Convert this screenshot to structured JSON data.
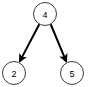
{
  "diagram": {
    "type": "directed-graph",
    "title": "",
    "background_color": "#ffffff",
    "node_fill_color": "#ffffff",
    "node_stroke_color": "#3a3a3a",
    "node_stroke_width": 1,
    "node_radius": 11.5,
    "label_color": "#000000",
    "edge_color": "#000000",
    "edge_width": 2,
    "arrowhead_style": "solid-triangle",
    "nodes": [
      {
        "id": "n4",
        "label": "4",
        "cx": 45,
        "cy": 14,
        "r": 11.5,
        "role": "root"
      },
      {
        "id": "n2",
        "label": "2",
        "cx": 14,
        "cy": 73,
        "r": 11.5,
        "role": "leaf"
      },
      {
        "id": "n5",
        "label": "5",
        "cx": 72,
        "cy": 73,
        "r": 11.5,
        "role": "leaf"
      }
    ],
    "edges": [
      {
        "id": "e-4-2",
        "from": "n4",
        "to": "n2",
        "from_label": "4",
        "to_label": "2",
        "directed": true,
        "x1": 39.4,
        "y1": 24.0,
        "x2": 19.8,
        "y2": 61.4
      },
      {
        "id": "e-4-5",
        "from": "n4",
        "to": "n5",
        "from_label": "4",
        "to_label": "5",
        "directed": true,
        "x1": 50.6,
        "y1": 24.0,
        "x2": 66.2,
        "y2": 61.4
      }
    ]
  }
}
